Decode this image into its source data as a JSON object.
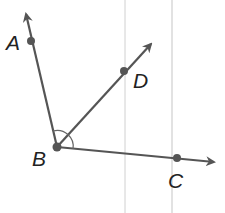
{
  "diagram": {
    "colors": {
      "ray": "#555555",
      "point": "#555555",
      "guide": "#cfcfcf",
      "label": "#222222"
    },
    "points": [
      {
        "id": "A",
        "label": "A",
        "x": 31,
        "y": 41
      },
      {
        "id": "B",
        "label": "B",
        "x": 57,
        "y": 147
      },
      {
        "id": "C",
        "label": "C",
        "x": 177,
        "y": 158
      },
      {
        "id": "D",
        "label": "D",
        "x": 124,
        "y": 71
      }
    ],
    "rays": [
      {
        "name": "BA",
        "from": "B",
        "through": "A"
      },
      {
        "name": "BD",
        "from": "B",
        "through": "D"
      },
      {
        "name": "BC",
        "from": "B",
        "through": "C"
      }
    ],
    "angle_mark": {
      "vertex": "B",
      "between": [
        "A",
        "C"
      ]
    }
  }
}
